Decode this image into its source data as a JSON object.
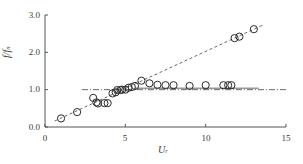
{
  "chart_data": {
    "type": "scatter",
    "title": "",
    "xlabel": "U_r",
    "ylabel": "f/f_n",
    "xlim": [
      0,
      15
    ],
    "ylim": [
      0,
      3.0
    ],
    "xticks": [
      0,
      5,
      10,
      15
    ],
    "xticklabels": [
      "0",
      "5",
      "10",
      "15"
    ],
    "yticks": [
      0.0,
      1.0,
      2.0,
      3.0
    ],
    "yticklabels": [
      "0.0",
      "1.0",
      "2.0",
      "3.0"
    ],
    "grid": false,
    "legend": null,
    "marker": "open-circle",
    "series": [
      {
        "name": "f/f_n measurements",
        "marker": "open-circle",
        "points": [
          [
            1.0,
            0.23
          ],
          [
            2.0,
            0.4
          ],
          [
            3.0,
            0.78
          ],
          [
            3.2,
            0.66
          ],
          [
            3.3,
            0.63
          ],
          [
            3.7,
            0.64
          ],
          [
            3.9,
            0.64
          ],
          [
            4.2,
            0.9
          ],
          [
            4.4,
            0.93
          ],
          [
            4.5,
            0.99
          ],
          [
            4.7,
            0.99
          ],
          [
            4.8,
            1.0
          ],
          [
            5.0,
            1.0
          ],
          [
            5.2,
            1.05
          ],
          [
            5.4,
            1.07
          ],
          [
            5.6,
            1.1
          ],
          [
            6.0,
            1.24
          ],
          [
            6.5,
            1.17
          ],
          [
            7.0,
            1.13
          ],
          [
            7.5,
            1.12
          ],
          [
            8.0,
            1.12
          ],
          [
            9.0,
            1.1
          ],
          [
            10.0,
            1.12
          ],
          [
            11.1,
            1.12
          ],
          [
            11.4,
            1.12
          ],
          [
            11.6,
            1.12
          ],
          [
            11.8,
            2.38
          ],
          [
            12.1,
            2.42
          ],
          [
            13.0,
            2.62
          ]
        ]
      }
    ],
    "reference_lines": [
      {
        "name": "natural-frequency-line",
        "style": "dash-dot",
        "orientation": "horizontal",
        "y": 1.0,
        "x_start": 2.3,
        "x_end": 15.0
      },
      {
        "name": "strouhal-line",
        "style": "dashed",
        "orientation": "sloped",
        "x_start": 0.6,
        "y_start": 0.16,
        "x_end": 13.6,
        "y_end": 2.74
      },
      {
        "name": "lock-in-upper-line",
        "style": "solid",
        "orientation": "horizontal",
        "y": 1.04,
        "x_start": 5.6,
        "x_end": 13.3
      }
    ]
  },
  "axes": {
    "y_label_main": "f",
    "y_label_den": "f",
    "y_label_sub": "n",
    "x_label_main": "U",
    "x_label_sub": "r"
  }
}
